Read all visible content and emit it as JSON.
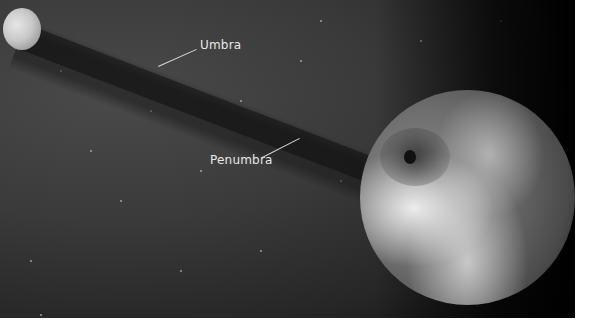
{
  "image": {
    "description": "Solar eclipse diagram: Moon casting umbra and penumbra shadow onto Earth",
    "labels": {
      "umbra": "Umbra",
      "penumbra": "Penumbra"
    },
    "objects": [
      "moon",
      "earth",
      "shadow-cone",
      "eclipse-spot"
    ],
    "colors": {
      "space": "#3a3a3a",
      "label_text": "#e8e8e8",
      "page_background": "#ffffff"
    }
  }
}
